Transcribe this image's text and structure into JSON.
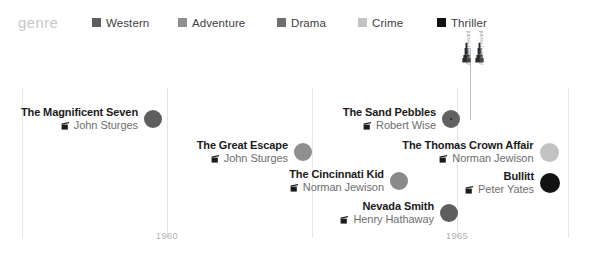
{
  "legend": {
    "title": "genre",
    "items": [
      {
        "label": "Western",
        "color": "#5e5e5e",
        "x": 92
      },
      {
        "label": "Adventure",
        "color": "#8f8f8f",
        "x": 178
      },
      {
        "label": "Drama",
        "color": "#6f6f6f",
        "x": 277
      },
      {
        "label": "Crime",
        "color": "#c2c2c2",
        "x": 358
      },
      {
        "label": "Thriller",
        "color": "#111111",
        "x": 437
      }
    ]
  },
  "axis": {
    "gridlines": [
      {
        "x": 22,
        "major": false
      },
      {
        "x": 167,
        "major": true
      },
      {
        "x": 312,
        "major": false
      },
      {
        "x": 457,
        "major": true
      },
      {
        "x": 568,
        "major": false
      }
    ],
    "ticks": [
      {
        "x": 167,
        "label": "1960"
      },
      {
        "x": 457,
        "label": "1965"
      }
    ]
  },
  "awards": {
    "line_x": 470,
    "badges": [
      {
        "x": 0,
        "caption": "Academy Award"
      },
      {
        "x": 13,
        "caption": "Academy Award"
      }
    ]
  },
  "chart_data": {
    "type": "scatter",
    "title": "",
    "xlabel": "",
    "ylabel": "",
    "xlim": [
      1959,
      1969
    ],
    "grid": true,
    "legend_position": "top",
    "categories": [
      "Western",
      "Adventure",
      "Drama",
      "Crime",
      "Thriller"
    ],
    "points": [
      {
        "title": "The Magnificent Seven",
        "director": "John Sturges",
        "genre": "Western",
        "color": "#5e5e5e",
        "year": 1960,
        "x": 172,
        "y": 79,
        "r": 9,
        "award": false
      },
      {
        "title": "The Great Escape",
        "director": "John Sturges",
        "genre": "Adventure",
        "color": "#8f8f8f",
        "year": 1963,
        "x": 322,
        "y": 112,
        "r": 9,
        "award": false
      },
      {
        "title": "The Sand Pebbles",
        "director": "Robert Wise",
        "genre": "Western",
        "color": "#616161",
        "year": 1966,
        "x": 470,
        "y": 79,
        "r": 9,
        "award": true
      },
      {
        "title": "The Cincinnati Kid",
        "director": "Norman Jewison",
        "genre": "Drama",
        "color": "#8a8a8a",
        "year": 1965,
        "x": 418,
        "y": 141,
        "r": 9,
        "award": false
      },
      {
        "title": "Nevada Smith",
        "director": "Henry Hathaway",
        "genre": "Western",
        "color": "#5e5e5e",
        "year": 1966,
        "x": 468,
        "y": 173,
        "r": 9,
        "award": false
      },
      {
        "title": "The Thomas Crown Affair",
        "director": "Norman Jewison",
        "genre": "Crime",
        "color": "#c2c2c2",
        "year": 1968,
        "x": 569,
        "y": 112,
        "r": 9.5,
        "award": false
      },
      {
        "title": "Bullitt",
        "director": "Peter Yates",
        "genre": "Thriller",
        "color": "#121212",
        "year": 1968,
        "x": 571,
        "y": 143,
        "r": 10,
        "award": false
      }
    ]
  }
}
